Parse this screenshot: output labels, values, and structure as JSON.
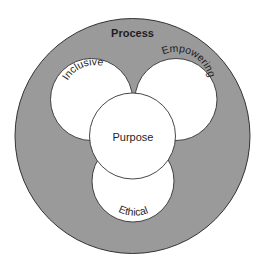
{
  "diagram": {
    "outer": {
      "label": "Process"
    },
    "circles": [
      {
        "id": "inclusive",
        "label": "Inclusive"
      },
      {
        "id": "empowering",
        "label": "Empowering"
      },
      {
        "id": "purpose",
        "label": "Purpose"
      },
      {
        "id": "ethical",
        "label": "Ethical"
      }
    ],
    "colors": {
      "ring_fill": "#9a9a9a",
      "circle_fill": "#ffffff",
      "stroke": "#333333",
      "text": "#1e1e1e"
    }
  }
}
